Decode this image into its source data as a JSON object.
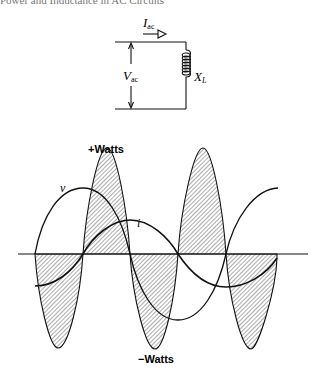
{
  "header": {
    "running_title": "Power and Inductance in AC Circuits"
  },
  "circuit": {
    "current_label": "I",
    "current_subscript": "ac",
    "voltage_label": "V",
    "voltage_subscript": "ac",
    "reactance_label": "X",
    "reactance_subscript": "L"
  },
  "waveform": {
    "voltage_label": "v",
    "current_label": "i",
    "positive_power_label": "+Watts",
    "negative_power_label": "−Watts"
  },
  "colors": {
    "stroke": "#111111",
    "hatch": "#444444",
    "background": "#ffffff"
  }
}
